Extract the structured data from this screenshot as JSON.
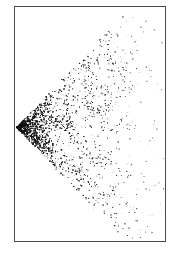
{
  "figure": {
    "frame": {
      "x": 14,
      "y": 6,
      "width": 152,
      "height": 236,
      "border_color": "#4a4a4a"
    },
    "wedge": {
      "apex": [
        16,
        127
      ],
      "upper_edge_end": [
        128,
        6
      ],
      "lower_edge_end": [
        132,
        242
      ],
      "point_color": "#111111",
      "density_profile": "dense near apex, fading toward right edge"
    }
  }
}
